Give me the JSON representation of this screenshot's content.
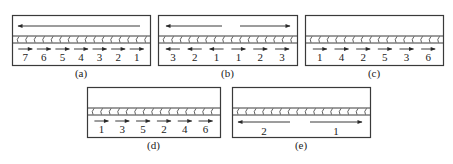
{
  "figure": {
    "panels": [
      {
        "id": "a",
        "caption": "(a)",
        "box": {
          "x": 12,
          "y": 15,
          "w": 138,
          "h": 50
        },
        "top_arrows": [
          {
            "x1": 140,
            "x2": 18,
            "dir": "left"
          }
        ],
        "segments": [
          {
            "label": "7",
            "dir": "right"
          },
          {
            "label": "6",
            "dir": "right"
          },
          {
            "label": "5",
            "dir": "right"
          },
          {
            "label": "4",
            "dir": "right"
          },
          {
            "label": "3",
            "dir": "right"
          },
          {
            "label": "2",
            "dir": "right"
          },
          {
            "label": "1",
            "dir": "right"
          }
        ],
        "long_arrows": []
      },
      {
        "id": "b",
        "caption": "(b)",
        "box": {
          "x": 158,
          "y": 15,
          "w": 139,
          "h": 50
        },
        "top_arrows": [
          {
            "x1": 222,
            "x2": 166,
            "dir": "left"
          },
          {
            "x1": 240,
            "x2": 290,
            "dir": "right"
          }
        ],
        "segments": [
          {
            "label": "3",
            "dir": "left"
          },
          {
            "label": "2",
            "dir": "left"
          },
          {
            "label": "1",
            "dir": "left"
          },
          {
            "label": "1",
            "dir": "right"
          },
          {
            "label": "2",
            "dir": "right"
          },
          {
            "label": "3",
            "dir": "right"
          }
        ],
        "long_arrows": []
      },
      {
        "id": "c",
        "caption": "(c)",
        "box": {
          "x": 305,
          "y": 15,
          "w": 138,
          "h": 50
        },
        "top_arrows": [],
        "segments": [
          {
            "label": "1",
            "dir": "right"
          },
          {
            "label": "4",
            "dir": "right"
          },
          {
            "label": "2",
            "dir": "right"
          },
          {
            "label": "5",
            "dir": "right"
          },
          {
            "label": "3",
            "dir": "right"
          },
          {
            "label": "6",
            "dir": "right"
          }
        ],
        "long_arrows": []
      },
      {
        "id": "d",
        "caption": "(d)",
        "box": {
          "x": 87,
          "y": 87,
          "w": 133,
          "h": 50
        },
        "top_arrows": [],
        "segments": [
          {
            "label": "1",
            "dir": "right"
          },
          {
            "label": "3",
            "dir": "right"
          },
          {
            "label": "5",
            "dir": "right"
          },
          {
            "label": "2",
            "dir": "right"
          },
          {
            "label": "4",
            "dir": "right"
          },
          {
            "label": "6",
            "dir": "right"
          }
        ],
        "long_arrows": []
      },
      {
        "id": "e",
        "caption": "(e)",
        "box": {
          "x": 232,
          "y": 87,
          "w": 138,
          "h": 50
        },
        "top_arrows": [],
        "segments": [],
        "long_arrows": [
          {
            "label": "2",
            "x1": 290,
            "x2": 238,
            "dir": "left"
          },
          {
            "label": "1",
            "x1": 310,
            "x2": 362,
            "dir": "right"
          }
        ]
      }
    ],
    "colors": {
      "line": "#3a3a3a",
      "text": "#222222",
      "background": "#ffffff"
    }
  }
}
